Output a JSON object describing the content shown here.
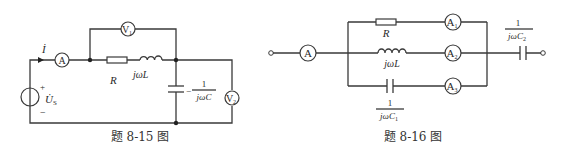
{
  "figure_15": {
    "caption": "题 8-15 图",
    "current_label": "İ",
    "source_label": "U̇",
    "source_sub": "S",
    "source_plus": "+",
    "source_minus": "−",
    "ammeter": "A",
    "voltmeter1": "V",
    "voltmeter1_sub": "1",
    "voltmeter2": "V",
    "voltmeter2_sub": "2",
    "resistor": "R",
    "inductor": "jωL",
    "capacitor_num": "1",
    "capacitor_sign": "−",
    "capacitor_den": "jωC"
  },
  "figure_16": {
    "caption": "题 8-16 图",
    "ammeter_main": "A",
    "ammeter1": "A",
    "ammeter1_sub": "1",
    "ammeter2": "A",
    "ammeter2_sub": "2",
    "ammeter3": "A",
    "ammeter3_sub": "3",
    "resistor": "R",
    "inductor": "jωL",
    "c1_num": "1",
    "c1_den": "jωC",
    "c1_sub": "1",
    "c2_num": "1",
    "c2_den": "jωC",
    "c2_sub": "2"
  }
}
